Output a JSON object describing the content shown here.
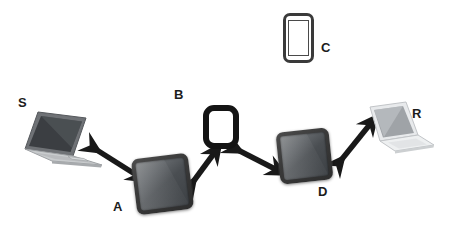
{
  "diagram": {
    "background_color": "#ffffff",
    "label_color": "#1c1c1c",
    "arrow_color": "#191919",
    "nodes": [
      {
        "id": "S",
        "label": "S",
        "device_type": "laptop",
        "style": "dark-gray-laptop",
        "label_x": 18,
        "label_y": 96,
        "device_x": 24,
        "device_y": 110
      },
      {
        "id": "A",
        "label": "A",
        "device_type": "tablet",
        "style": "dark-glossy-tablet",
        "label_x": 113,
        "label_y": 200,
        "device_x": 134,
        "device_y": 156
      },
      {
        "id": "B",
        "label": "B",
        "device_type": "tablet",
        "style": "black-outline-tablet",
        "label_x": 174,
        "label_y": 88,
        "device_x": 203,
        "device_y": 105
      },
      {
        "id": "C",
        "label": "C",
        "device_type": "smartphone",
        "style": "dark-outline-phone",
        "label_x": 321,
        "label_y": 41,
        "device_x": 283,
        "device_y": 13
      },
      {
        "id": "D",
        "label": "D",
        "device_type": "tablet",
        "style": "dark-glossy-tablet",
        "label_x": 318,
        "label_y": 185,
        "device_x": 278,
        "device_y": 130
      },
      {
        "id": "R",
        "label": "R",
        "device_type": "laptop",
        "style": "white-laptop-mirrored",
        "label_x": 412,
        "label_y": 107,
        "device_x": 364,
        "device_y": 103
      }
    ],
    "links": [
      {
        "id": "link-s-a",
        "from": "S",
        "to": "A",
        "arrowheads": "both"
      },
      {
        "id": "link-a-b",
        "from": "A",
        "to": "B",
        "arrowheads": "both"
      },
      {
        "id": "link-b-d",
        "from": "B",
        "to": "D",
        "arrowheads": "both"
      },
      {
        "id": "link-d-r",
        "from": "D",
        "to": "R",
        "arrowheads": "both"
      }
    ],
    "unconnected_nodes": [
      "C"
    ]
  }
}
